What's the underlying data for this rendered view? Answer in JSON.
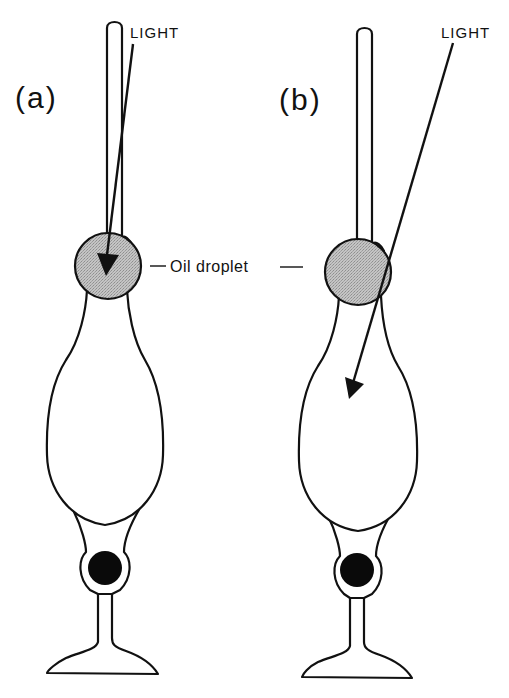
{
  "figure": {
    "type": "diagram"
  },
  "panels": [
    {
      "id": "a",
      "label": "(a)",
      "light_label": "LIGHT",
      "light_path": "axial - passes through oil droplet"
    },
    {
      "id": "b",
      "label": "(b)",
      "light_label": "LIGHT",
      "light_path": "oblique - bypasses oil droplet into inner segment"
    }
  ],
  "annotations": {
    "oil_droplet_label": "Oil droplet"
  },
  "colors": {
    "outline": "#111111",
    "droplet_fill": "#b8b8b8",
    "nucleus_fill": "#0a0a0a",
    "background": "#ffffff"
  }
}
